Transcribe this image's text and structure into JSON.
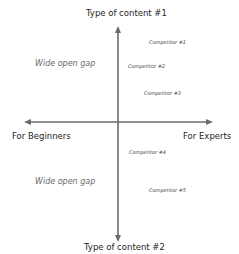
{
  "diagram": {
    "type": "positioning-map",
    "axis_color": "#6b6b6b",
    "axes": {
      "top": "Type of content #1",
      "bottom": "Type of content #2",
      "left": "For Beginners",
      "right": "For Experts"
    },
    "gaps": [
      {
        "label": "Wide open gap",
        "quadrant": "top-left"
      },
      {
        "label": "Wide open gap",
        "quadrant": "bottom-left"
      }
    ],
    "competitors": [
      {
        "label": "Competitor #1",
        "quadrant": "top-right"
      },
      {
        "label": "Competitor #2",
        "quadrant": "top-right"
      },
      {
        "label": "Competitor #3",
        "quadrant": "top-right"
      },
      {
        "label": "Competitor #4",
        "quadrant": "bottom-right"
      },
      {
        "label": "Competitor #5",
        "quadrant": "bottom-right"
      }
    ]
  }
}
